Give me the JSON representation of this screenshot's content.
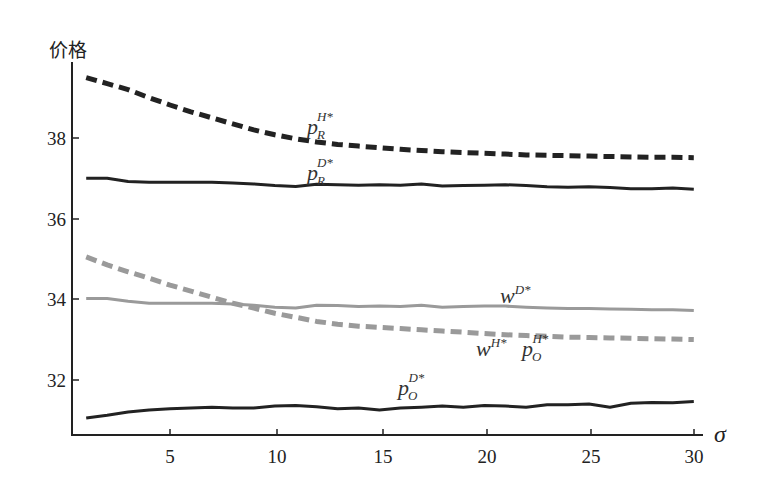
{
  "chart_data": {
    "type": "line",
    "title": "",
    "xlabel": "σ",
    "ylabel": "价格",
    "xlim": [
      0.3,
      30.4
    ],
    "ylim": [
      30.6,
      39.85
    ],
    "xticks": [
      5,
      10,
      15,
      20,
      25,
      30
    ],
    "yticks": [
      32,
      34,
      36,
      38
    ],
    "grid": false,
    "legend": "inline labels",
    "series": [
      {
        "name": "p_R^{H*}",
        "label_base": "p",
        "label_sub": "R",
        "label_sup": "H*",
        "style": "dashed",
        "color": "#222222",
        "width": 5,
        "x": [
          1,
          2,
          3,
          4,
          5,
          6,
          7,
          8,
          9,
          10,
          11,
          12,
          13,
          14,
          15,
          16,
          17,
          18,
          19,
          20,
          21,
          22,
          23,
          24,
          25,
          26,
          27,
          28,
          29,
          30
        ],
        "y": [
          39.5,
          39.35,
          39.2,
          39.0,
          38.82,
          38.65,
          38.5,
          38.35,
          38.2,
          38.08,
          37.98,
          37.9,
          37.84,
          37.8,
          37.76,
          37.72,
          37.69,
          37.66,
          37.64,
          37.62,
          37.6,
          37.58,
          37.57,
          37.56,
          37.55,
          37.54,
          37.53,
          37.52,
          37.52,
          37.51
        ]
      },
      {
        "name": "p_R^{D*}",
        "label_base": "p",
        "label_sub": "R",
        "label_sup": "D*",
        "style": "solid",
        "color": "#222222",
        "width": 3,
        "x": [
          1,
          2,
          3,
          4,
          5,
          6,
          7,
          8,
          9,
          10,
          11,
          12,
          13,
          14,
          15,
          16,
          17,
          18,
          19,
          20,
          21,
          22,
          23,
          24,
          25,
          26,
          27,
          28,
          29,
          30
        ],
        "y": [
          37.0,
          37.0,
          36.92,
          36.9,
          36.9,
          36.9,
          36.9,
          36.88,
          36.86,
          36.82,
          36.8,
          36.85,
          36.84,
          36.83,
          36.84,
          36.83,
          36.86,
          36.81,
          36.82,
          36.83,
          36.84,
          36.82,
          36.79,
          36.78,
          36.79,
          36.77,
          36.74,
          36.74,
          36.76,
          36.73
        ]
      },
      {
        "name": "w^{D*}",
        "label_base": "w",
        "label_sub": "",
        "label_sup": "D*",
        "style": "solid",
        "color": "#9a9a9a",
        "width": 3,
        "x": [
          1,
          2,
          3,
          4,
          5,
          6,
          7,
          8,
          9,
          10,
          11,
          12,
          13,
          14,
          15,
          16,
          17,
          18,
          19,
          20,
          21,
          22,
          23,
          24,
          25,
          26,
          27,
          28,
          29,
          30
        ],
        "y": [
          34.02,
          34.02,
          33.95,
          33.9,
          33.9,
          33.9,
          33.9,
          33.88,
          33.85,
          33.8,
          33.78,
          33.85,
          33.84,
          33.82,
          33.83,
          33.82,
          33.85,
          33.8,
          33.82,
          33.83,
          33.83,
          33.8,
          33.78,
          33.77,
          33.77,
          33.76,
          33.75,
          33.74,
          33.74,
          33.72
        ]
      },
      {
        "name": "w^{H*} = p_O^{H*}",
        "label_base": "w / p",
        "label_sub": "O",
        "label_sup": "H*",
        "style": "dashed",
        "color": "#9a9a9a",
        "width": 5,
        "x": [
          1,
          2,
          3,
          4,
          5,
          6,
          7,
          8,
          9,
          10,
          11,
          12,
          13,
          14,
          15,
          16,
          17,
          18,
          19,
          20,
          21,
          22,
          23,
          24,
          25,
          26,
          27,
          28,
          29,
          30
        ],
        "y": [
          35.05,
          34.85,
          34.68,
          34.52,
          34.35,
          34.2,
          34.05,
          33.9,
          33.78,
          33.65,
          33.55,
          33.45,
          33.38,
          33.33,
          33.3,
          33.27,
          33.24,
          33.21,
          33.18,
          33.15,
          33.12,
          33.1,
          33.08,
          33.06,
          33.05,
          33.04,
          33.03,
          33.02,
          33.01,
          33.0
        ]
      },
      {
        "name": "p_O^{D*}",
        "label_base": "p",
        "label_sub": "O",
        "label_sup": "D*",
        "style": "solid",
        "color": "#222222",
        "width": 3,
        "x": [
          1,
          2,
          3,
          4,
          5,
          6,
          7,
          8,
          9,
          10,
          11,
          12,
          13,
          14,
          15,
          16,
          17,
          18,
          19,
          20,
          21,
          22,
          23,
          24,
          25,
          26,
          27,
          28,
          29,
          30
        ],
        "y": [
          31.05,
          31.12,
          31.2,
          31.25,
          31.28,
          31.3,
          31.32,
          31.3,
          31.3,
          31.35,
          31.36,
          31.33,
          31.28,
          31.3,
          31.25,
          31.3,
          31.32,
          31.35,
          31.32,
          31.36,
          31.35,
          31.32,
          31.38,
          31.38,
          31.4,
          31.32,
          31.42,
          31.44,
          31.43,
          31.46
        ]
      }
    ],
    "annotations": [
      {
        "text": "p_R^{H*}",
        "x": 12.2,
        "y": 38.25
      },
      {
        "text": "p_R^{D*}",
        "x": 12.2,
        "y": 37.0
      },
      {
        "text": "w^{D*}",
        "x": 20.6,
        "y": 34.0
      },
      {
        "text": "w^{H*}",
        "x": 19.9,
        "y": 32.7
      },
      {
        "text": "p_O^{H*}",
        "x": 22.3,
        "y": 32.7
      },
      {
        "text": "p_O^{D*}",
        "x": 15.4,
        "y": 31.6
      }
    ]
  },
  "axes": {
    "y_title": "价格",
    "x_title": "σ",
    "x_tick_labels": [
      "5",
      "10",
      "15",
      "20",
      "25",
      "30"
    ],
    "y_tick_labels": [
      "32",
      "34",
      "36",
      "38"
    ]
  },
  "labels": {
    "prH": {
      "base": "p",
      "sub": "R",
      "sup": "H*"
    },
    "prD": {
      "base": "p",
      "sub": "R",
      "sup": "D*"
    },
    "wD": {
      "base": "w",
      "sup": "D*"
    },
    "wH": {
      "base": "w",
      "sup": "H*"
    },
    "poH": {
      "base": "p",
      "sub": "O",
      "sup": "H*"
    },
    "poD": {
      "base": "p",
      "sub": "O",
      "sup": "D*"
    }
  }
}
